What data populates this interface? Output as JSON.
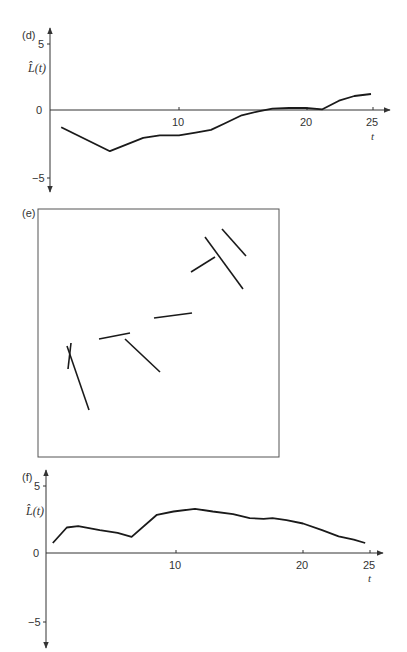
{
  "chart_data": [
    {
      "panel": "(d)",
      "type": "line",
      "title": "",
      "xlabel": "t",
      "ylabel": "L̂(t)",
      "xticks": [
        10,
        20,
        25
      ],
      "yticks": [
        5,
        0,
        -5
      ],
      "xlim": [
        0,
        26
      ],
      "ylim": [
        -5.5,
        5.5
      ],
      "grid": false,
      "x": [
        0.8,
        4.6,
        7.2,
        8.5,
        10.0,
        11.3,
        12.5,
        13.6,
        14.9,
        16.2,
        17.3,
        18.6,
        19.9,
        21.2,
        22.5,
        23.7,
        25.0
      ],
      "y": [
        -1.3,
        -3.1,
        -2.1,
        -1.9,
        -1.9,
        -1.7,
        -1.5,
        -1.0,
        -0.4,
        -0.1,
        0.1,
        0.15,
        0.15,
        0.05,
        0.7,
        1.05,
        1.2
      ]
    },
    {
      "panel": "(e)",
      "type": "scatter",
      "title": "",
      "description": "Line segment pattern inside a square window",
      "segments": [
        {
          "x1": 205,
          "y1": 237,
          "x2": 243,
          "y2": 289
        },
        {
          "x1": 222,
          "y1": 229,
          "x2": 246,
          "y2": 256
        },
        {
          "x1": 191,
          "y1": 272,
          "x2": 215,
          "y2": 257
        },
        {
          "x1": 154,
          "y1": 318,
          "x2": 192,
          "y2": 313
        },
        {
          "x1": 99,
          "y1": 339,
          "x2": 130,
          "y2": 333
        },
        {
          "x1": 125,
          "y1": 339,
          "x2": 160,
          "y2": 372
        },
        {
          "x1": 67,
          "y1": 346,
          "x2": 89,
          "y2": 410
        },
        {
          "x1": 71,
          "y1": 343,
          "x2": 68,
          "y2": 369
        }
      ],
      "window": {
        "x": 38,
        "y": 209,
        "width": 241,
        "height": 248
      }
    },
    {
      "panel": "(f)",
      "type": "line",
      "title": "",
      "xlabel": "t",
      "ylabel": "L̂(t)",
      "xticks": [
        10,
        20,
        25
      ],
      "yticks": [
        5,
        0,
        -5
      ],
      "xlim": [
        0,
        26
      ],
      "ylim": [
        -5.5,
        5.5
      ],
      "grid": false,
      "x": [
        0.3,
        1.4,
        2.3,
        4.0,
        5.4,
        6.5,
        8.5,
        9.8,
        11.5,
        12.9,
        14.5,
        15.8,
        16.9,
        17.6,
        18.7,
        20.0,
        21.5,
        22.8,
        24.0,
        24.9
      ],
      "y": [
        0.75,
        1.9,
        2.0,
        1.7,
        1.5,
        1.2,
        2.85,
        3.1,
        3.3,
        3.1,
        2.9,
        2.6,
        2.55,
        2.6,
        2.45,
        2.2,
        1.7,
        1.25,
        1.0,
        0.75
      ]
    }
  ],
  "panels": {
    "d": {
      "label": "(d)",
      "ylabel": "L̂(t)",
      "xlabel": "t",
      "ytick_top": "5",
      "ytick_zero": "0",
      "ytick_bottom": "−5",
      "xtick_1": "10",
      "xtick_2": "20",
      "xtick_3": "25"
    },
    "e": {
      "label": "(e)"
    },
    "f": {
      "label": "(f)",
      "ylabel": "L̂(t)",
      "xlabel": "t",
      "ytick_top": "5",
      "ytick_zero": "0",
      "ytick_bottom": "−5",
      "xtick_1": "10",
      "xtick_2": "20",
      "xtick_3": "25"
    }
  }
}
